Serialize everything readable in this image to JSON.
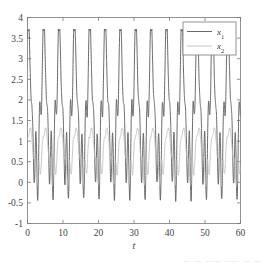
{
  "figure": {
    "background": "#ffffff",
    "axis_color": "#888888",
    "tick_color": "#777777",
    "label_color": "#444444"
  },
  "caption_fragment": "— — —— —— — —",
  "chart_data": {
    "type": "line",
    "title": "",
    "subtitle": "",
    "xlabel": "t",
    "ylabel": "",
    "xlim": [
      0,
      60
    ],
    "ylim": [
      -1,
      4
    ],
    "xticks": [
      0,
      10,
      20,
      30,
      40,
      50,
      60
    ],
    "xticklabels": [
      "0",
      "10",
      "20",
      "30",
      "40",
      "50",
      "60"
    ],
    "yticks": [
      -1,
      -0.5,
      0,
      0.5,
      1,
      1.5,
      2,
      2.5,
      3,
      3.5,
      4
    ],
    "yticklabels": [
      "-1",
      "-0.5",
      "0",
      "0.5",
      "1",
      "1.5",
      "2",
      "2.5",
      "3",
      "3.5",
      "4"
    ],
    "grid": false,
    "box": true,
    "tick_direction": "in",
    "legend": {
      "position": "upper right",
      "border": true,
      "entries": [
        {
          "name": "x_1",
          "label": "x",
          "sub": "1",
          "color": "#595959",
          "width": 0.9
        },
        {
          "name": "x_2",
          "label": "x",
          "sub": "2",
          "color": "#c0c0c0",
          "width": 0.9
        }
      ]
    },
    "series": [
      {
        "name": "x_1",
        "color": "#595959",
        "linewidth": 0.9,
        "description": "Fast chaotic-like oscillation with large recurring peaks near 3.4-3.7 and troughs near -0.7, period approx 4.3",
        "params": {
          "base_level": 1.35,
          "slow_amp": 1.05,
          "slow_period": 4.32,
          "slow_phase": 1.15,
          "fast_amp": 0.95,
          "fast_period": 1.08,
          "fast_phase": 0.35,
          "peak_boost": 1.55,
          "peak_sharpness": 7.5,
          "noise_amp": 0.05,
          "ymin": -0.72,
          "ymax": 3.72
        },
        "sample_points": {
          "t": [
            0,
            0.5,
            1.0,
            1.6,
            2.2,
            2.8,
            3.4,
            4.0,
            4.6,
            5.2,
            5.8,
            6.4,
            7.0,
            8.6,
            9.2,
            10.0,
            13.0,
            17.3,
            21.6,
            26.0,
            30.3,
            34.6,
            38.9,
            43.2,
            47.5,
            51.8,
            56.1,
            60
          ],
          "y": [
            2.9,
            3.55,
            1.5,
            0.6,
            -0.35,
            1.55,
            0.1,
            3.65,
            1.3,
            0.45,
            -0.65,
            2.05,
            0.2,
            2.15,
            3.55,
            0.7,
            3.5,
            3.65,
            3.6,
            3.62,
            3.65,
            3.6,
            3.68,
            3.6,
            3.62,
            3.58,
            3.6,
            3.3
          ]
        }
      },
      {
        "name": "x_2",
        "color": "#c0c0c0",
        "linewidth": 0.9,
        "description": "Lower amplitude oscillation bounded roughly between -0.1 and 1.32, same driving period as x_1",
        "params": {
          "base_level": 0.6,
          "slow_amp": 0.42,
          "slow_period": 4.32,
          "slow_phase": 0.55,
          "fast_amp": 0.3,
          "fast_period": 1.08,
          "fast_phase": 1.9,
          "peak_boost": 0.3,
          "peak_sharpness": 4.0,
          "noise_amp": 0.03,
          "ymin": -0.12,
          "ymax": 1.32
        },
        "sample_points": {
          "t": [
            0,
            0.8,
            1.7,
            2.6,
            3.5,
            4.3,
            5.2,
            6.1,
            7.0,
            8.6,
            10.0,
            13.0,
            17.3,
            21.6,
            26.0,
            30.3,
            34.6,
            38.9,
            43.2,
            47.5,
            51.8,
            56.1,
            60
          ],
          "y": [
            1.0,
            0.35,
            0.9,
            0.1,
            1.25,
            0.3,
            0.8,
            0.0,
            1.2,
            0.45,
            1.28,
            1.26,
            1.3,
            1.28,
            1.25,
            1.3,
            1.27,
            1.26,
            1.3,
            1.24,
            1.28,
            1.26,
            0.95
          ]
        }
      }
    ]
  }
}
